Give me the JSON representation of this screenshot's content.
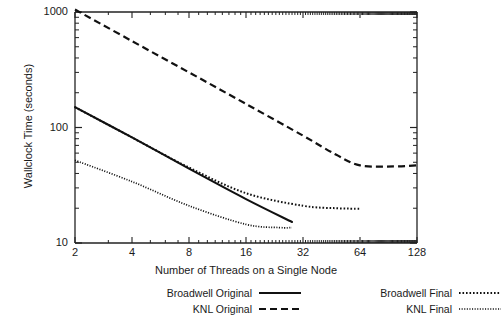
{
  "chart_data": {
    "type": "line",
    "title": "",
    "xlabel": "Number of Threads on a Single Node",
    "ylabel": "Wallclock Time (seconds)",
    "xscale": "log2",
    "yscale": "log10",
    "xlim": [
      2,
      128
    ],
    "ylim": [
      10,
      1000
    ],
    "xticks": [
      2,
      4,
      8,
      16,
      32,
      64,
      128
    ],
    "xtick_labels": [
      "2",
      "4",
      "8",
      "16",
      "32",
      "64",
      "128"
    ],
    "yticks": [
      10,
      100,
      1000
    ],
    "ytick_labels": [
      "10",
      "100",
      "1000"
    ],
    "grid": false,
    "legend_position": "below-axes",
    "series": [
      {
        "name": "Broadwell Original",
        "style": "solid",
        "x": [
          2,
          4,
          8,
          16,
          28
        ],
        "y": [
          150,
          82,
          44,
          24,
          15.2
        ]
      },
      {
        "name": "KNL Original",
        "style": "dashed",
        "x": [
          2,
          4,
          8,
          16,
          32,
          48,
          64,
          96,
          128
        ],
        "y": [
          1050,
          560,
          300,
          160,
          85,
          58,
          47,
          46,
          47
        ]
      },
      {
        "name": "Broadwell Final",
        "style": "dotted",
        "x": [
          2,
          4,
          8,
          16,
          32,
          48,
          64
        ],
        "y": [
          150,
          82,
          45,
          27,
          21,
          20,
          19.8
        ]
      },
      {
        "name": "KNL Final",
        "style": "fine-dotted",
        "x": [
          2,
          4,
          8,
          16,
          24,
          28
        ],
        "y": [
          52,
          34,
          21,
          14.5,
          13.6,
          13.6
        ]
      }
    ]
  },
  "legend": {
    "entries": [
      {
        "label": "Broadwell Original",
        "style": "solid",
        "column": "left",
        "row": 0
      },
      {
        "label": "KNL Original",
        "style": "dashed",
        "column": "left",
        "row": 1
      },
      {
        "label": "Broadwell Final",
        "style": "dotted",
        "column": "right",
        "row": 0
      },
      {
        "label": "KNL Final",
        "style": "fine-dotted",
        "column": "right",
        "row": 1
      }
    ]
  },
  "style": {
    "line_color": "#111111",
    "axis_color": "#222222",
    "background": "#ffffff"
  }
}
